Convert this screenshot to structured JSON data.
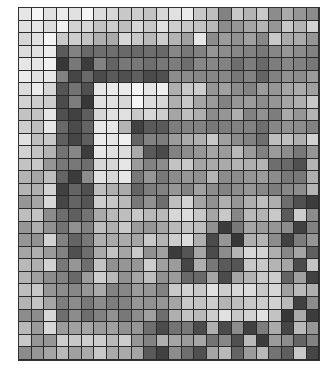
{
  "grid": {
    "rows": 28,
    "cols": 24,
    "line_color": "#2a2a2a",
    "values": [
      [
        230,
        245,
        225,
        235,
        225,
        245,
        220,
        215,
        200,
        205,
        195,
        215,
        225,
        235,
        200,
        190,
        130,
        200,
        180,
        200,
        140,
        170,
        150,
        140
      ],
      [
        225,
        230,
        220,
        240,
        210,
        215,
        195,
        205,
        190,
        215,
        200,
        225,
        205,
        200,
        195,
        185,
        140,
        150,
        165,
        180,
        150,
        200,
        180,
        210
      ],
      [
        215,
        225,
        245,
        200,
        205,
        195,
        175,
        170,
        215,
        200,
        185,
        205,
        180,
        160,
        230,
        140,
        155,
        145,
        160,
        135,
        200,
        170,
        170,
        150
      ],
      [
        220,
        225,
        235,
        90,
        130,
        105,
        110,
        110,
        105,
        105,
        110,
        105,
        135,
        120,
        130,
        150,
        140,
        135,
        130,
        120,
        135,
        150,
        140,
        130
      ],
      [
        230,
        230,
        240,
        55,
        120,
        60,
        130,
        100,
        120,
        120,
        110,
        120,
        125,
        110,
        135,
        135,
        130,
        110,
        125,
        105,
        125,
        135,
        130,
        120
      ],
      [
        235,
        225,
        230,
        130,
        70,
        105,
        75,
        90,
        80,
        95,
        75,
        80,
        140,
        140,
        135,
        135,
        135,
        120,
        130,
        100,
        130,
        145,
        140,
        155
      ],
      [
        220,
        235,
        215,
        85,
        115,
        80,
        230,
        235,
        235,
        245,
        230,
        240,
        175,
        200,
        205,
        150,
        160,
        140,
        130,
        155,
        150,
        165,
        170,
        160
      ],
      [
        210,
        205,
        205,
        75,
        125,
        55,
        225,
        225,
        215,
        245,
        220,
        215,
        175,
        200,
        165,
        155,
        130,
        150,
        155,
        140,
        150,
        165,
        175,
        200
      ],
      [
        195,
        195,
        230,
        80,
        65,
        95,
        215,
        225,
        225,
        200,
        215,
        205,
        165,
        190,
        175,
        140,
        150,
        175,
        130,
        145,
        125,
        170,
        150,
        180
      ],
      [
        205,
        190,
        230,
        105,
        75,
        100,
        230,
        230,
        180,
        65,
        90,
        90,
        125,
        130,
        130,
        120,
        125,
        130,
        130,
        110,
        135,
        145,
        140,
        130
      ],
      [
        225,
        190,
        200,
        95,
        70,
        95,
        235,
        230,
        240,
        100,
        130,
        125,
        155,
        170,
        175,
        200,
        160,
        140,
        130,
        110,
        190,
        190,
        175,
        210
      ],
      [
        210,
        195,
        180,
        115,
        135,
        60,
        230,
        225,
        220,
        170,
        90,
        75,
        130,
        140,
        150,
        165,
        155,
        185,
        155,
        130,
        155,
        140,
        120,
        150
      ],
      [
        195,
        200,
        150,
        120,
        120,
        110,
        215,
        215,
        230,
        155,
        130,
        140,
        195,
        200,
        165,
        170,
        170,
        180,
        175,
        180,
        110,
        105,
        80,
        180
      ],
      [
        180,
        165,
        190,
        100,
        60,
        140,
        225,
        215,
        230,
        120,
        150,
        120,
        140,
        150,
        145,
        180,
        140,
        140,
        150,
        155,
        140,
        120,
        120,
        175
      ],
      [
        180,
        175,
        210,
        65,
        100,
        80,
        190,
        175,
        170,
        100,
        125,
        130,
        150,
        130,
        160,
        140,
        130,
        140,
        150,
        135,
        125,
        135,
        140,
        180
      ],
      [
        150,
        165,
        215,
        70,
        100,
        85,
        205,
        200,
        185,
        120,
        145,
        110,
        190,
        210,
        165,
        145,
        175,
        150,
        175,
        190,
        175,
        110,
        80,
        60
      ],
      [
        190,
        195,
        140,
        110,
        95,
        115,
        170,
        185,
        190,
        200,
        185,
        185,
        215,
        220,
        200,
        165,
        200,
        135,
        185,
        180,
        200,
        90,
        205,
        140
      ],
      [
        150,
        175,
        145,
        115,
        145,
        130,
        190,
        175,
        200,
        155,
        150,
        165,
        185,
        195,
        190,
        145,
        60,
        120,
        165,
        155,
        150,
        140,
        65,
        130
      ],
      [
        150,
        145,
        210,
        130,
        100,
        120,
        175,
        170,
        170,
        165,
        200,
        180,
        205,
        220,
        175,
        75,
        150,
        55,
        175,
        180,
        140,
        65,
        125,
        150
      ],
      [
        165,
        175,
        155,
        130,
        80,
        110,
        170,
        195,
        165,
        200,
        145,
        160,
        60,
        85,
        165,
        75,
        140,
        180,
        215,
        210,
        175,
        135,
        165,
        95
      ],
      [
        185,
        175,
        210,
        120,
        150,
        110,
        195,
        145,
        150,
        150,
        205,
        160,
        155,
        70,
        175,
        120,
        90,
        85,
        200,
        200,
        180,
        165,
        75,
        195
      ],
      [
        180,
        160,
        140,
        130,
        105,
        155,
        205,
        185,
        145,
        165,
        190,
        145,
        155,
        105,
        105,
        165,
        75,
        165,
        180,
        200,
        205,
        100,
        160,
        65
      ],
      [
        190,
        200,
        150,
        140,
        135,
        150,
        170,
        130,
        135,
        155,
        150,
        130,
        200,
        210,
        200,
        225,
        205,
        215,
        220,
        200,
        215,
        160,
        185,
        175
      ],
      [
        180,
        195,
        165,
        125,
        140,
        120,
        140,
        125,
        130,
        150,
        145,
        150,
        165,
        200,
        195,
        205,
        180,
        190,
        200,
        205,
        210,
        185,
        65,
        140
      ],
      [
        140,
        140,
        215,
        110,
        140,
        110,
        130,
        145,
        120,
        140,
        160,
        110,
        175,
        195,
        185,
        205,
        225,
        200,
        210,
        225,
        195,
        55,
        170,
        60
      ],
      [
        185,
        155,
        215,
        155,
        160,
        165,
        155,
        160,
        145,
        150,
        110,
        75,
        115,
        120,
        75,
        175,
        75,
        140,
        65,
        125,
        170,
        70,
        185,
        150
      ],
      [
        200,
        150,
        150,
        205,
        200,
        205,
        205,
        185,
        205,
        150,
        130,
        175,
        165,
        155,
        165,
        115,
        135,
        80,
        185,
        60,
        155,
        140,
        100,
        130
      ],
      [
        140,
        150,
        165,
        185,
        160,
        170,
        200,
        170,
        170,
        165,
        90,
        65,
        140,
        110,
        80,
        165,
        185,
        100,
        155,
        185,
        115,
        95,
        200,
        70
      ]
    ]
  }
}
